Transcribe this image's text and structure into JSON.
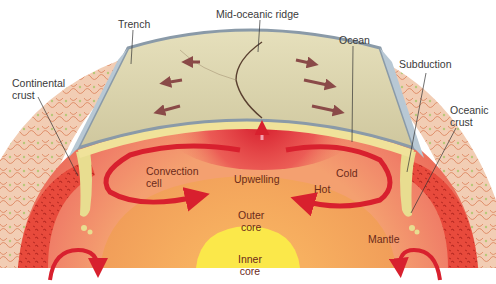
{
  "diagram": {
    "labels": {
      "trench": "Trench",
      "mid_oceanic_ridge": "Mid-oceanic ridge",
      "ocean": "Ocean",
      "subduction": "Subduction",
      "continental_crust": "Continental\ncrust",
      "oceanic_crust": "Oceanic\ncrust",
      "convection_cell": "Convection\ncell",
      "upwelling": "Upwelling",
      "cold": "Cold",
      "hot": "Hot",
      "outer_core": "Outer\ncore",
      "mantle": "Mantle",
      "inner_core": "Inner\ncore"
    },
    "colors": {
      "ocean_plate": "#dcd6b0",
      "ocean_edge": "#8a9aa8",
      "mantle": "#ef7e6a",
      "upwelling": "#d8202e",
      "outer_core": "#f5a35a",
      "inner_core": "#fbe84a",
      "crust_texture": "#e2463a",
      "slab": "#e8dd90",
      "arrow": "#d8202e",
      "plate_arrow": "#8a4a48"
    }
  }
}
